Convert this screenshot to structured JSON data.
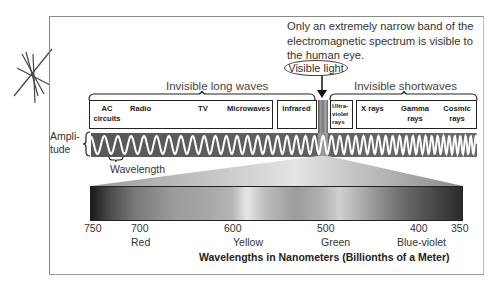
{
  "caption": "Only an extremely narrow band of the electromagnetic spectrum is visible to the human eye.",
  "visible_light_label": "Visible light",
  "groups": {
    "long": "Invisible long waves",
    "short": "Invisible shortwaves"
  },
  "long_wave_box": {
    "items": [
      {
        "label": "AC circuits"
      },
      {
        "label": "Radio"
      },
      {
        "label": "TV"
      },
      {
        "label": "Microwaves"
      }
    ]
  },
  "infrared_label": "Infrared",
  "uv_label": "Ultra-violet rays",
  "short_wave_box": {
    "items": [
      {
        "label": "X rays"
      },
      {
        "label": "Gamma rays"
      },
      {
        "label": "Cosmic rays"
      }
    ]
  },
  "amplitude_label": "Ampli-tude",
  "wavelength_label": "Wavelength",
  "spectrum_axis": {
    "ticks": [
      "750",
      "700",
      "600",
      "500",
      "400",
      "350"
    ],
    "colors": [
      "Red",
      "Yellow",
      "Green",
      "Blue-violet"
    ],
    "title": "Wavelengths in Nanometers (Billionths of a Meter)"
  },
  "chart_data": {
    "type": "diagram",
    "title": "Electromagnetic spectrum",
    "bands_long_to_short": [
      "AC circuits",
      "Radio",
      "TV",
      "Microwaves",
      "Infrared",
      "Visible light",
      "Ultra-violet rays",
      "X rays",
      "Gamma rays",
      "Cosmic rays"
    ],
    "visible_range_nm": [
      750,
      350
    ],
    "ticks_nm": [
      750,
      700,
      600,
      500,
      400,
      350
    ],
    "color_labels": {
      "700": "Red",
      "600": "Yellow",
      "500": "Green",
      "400": "Blue-violet"
    }
  }
}
